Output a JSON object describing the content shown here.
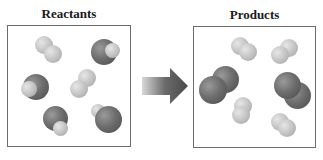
{
  "diagram": {
    "reactants": {
      "title": "Reactants",
      "molecules": [
        {
          "type": "light-diatomic",
          "atoms": 2
        },
        {
          "type": "dark-light-diatomic",
          "atoms": 2
        },
        {
          "type": "dark-light-diatomic",
          "atoms": 2
        },
        {
          "type": "light-diatomic",
          "atoms": 2
        },
        {
          "type": "dark-light-diatomic",
          "atoms": 2
        },
        {
          "type": "dark-light-diatomic",
          "atoms": 2
        }
      ]
    },
    "arrow": {
      "icon": "right-arrow-icon",
      "direction": "right"
    },
    "products": {
      "title": "Products",
      "molecules": [
        {
          "type": "light-diatomic",
          "atoms": 2
        },
        {
          "type": "light-diatomic",
          "atoms": 2
        },
        {
          "type": "dark-diatomic",
          "atoms": 2
        },
        {
          "type": "dark-diatomic",
          "atoms": 2
        },
        {
          "type": "light-diatomic",
          "atoms": 2
        },
        {
          "type": "light-diatomic",
          "atoms": 2
        }
      ]
    },
    "colors": {
      "dark_atom": "#6e6e6e",
      "light_atom": "#c4c4c4",
      "box_border": "#6b6b6b",
      "arrow": "#5a5a5a"
    }
  }
}
